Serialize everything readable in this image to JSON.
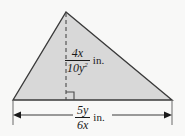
{
  "figure": {
    "name": "triangle-dimension-diagram",
    "shape": "triangle",
    "colors": {
      "background": "#f8f8f7",
      "fill": "#d8d8d8",
      "stroke": "#3a3a3a",
      "text": "#1a1a1a"
    },
    "geometry": {
      "apex": [
        66,
        12
      ],
      "bottom_left": [
        13,
        100
      ],
      "bottom_right": [
        172,
        100
      ],
      "altitude_foot": [
        66,
        100
      ],
      "dimension_line_y": 115,
      "extension_line_left_x": 13,
      "extension_line_right_x": 172
    },
    "height_label": {
      "numerator": "4x",
      "denominator": "10y",
      "denominator_exponent": "2",
      "unit": "in."
    },
    "base_label": {
      "numerator": "5y",
      "denominator": "6x",
      "unit": "in."
    },
    "markers": {
      "right_angle": "right-angle-square",
      "altitude_style": "dashed",
      "dimension_arrows": "double-headed"
    }
  }
}
